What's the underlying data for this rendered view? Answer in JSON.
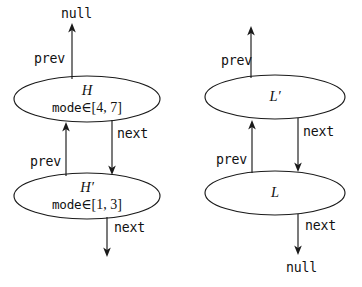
{
  "diagram": {
    "type": "doubly-linked-list-node-diagram",
    "nodes": [
      {
        "id": "H",
        "label": "H",
        "detail_name": "mode",
        "detail_relation": "∈",
        "detail_value": "[4, 7]"
      },
      {
        "id": "Hp",
        "label": "H′",
        "detail_name": "mode",
        "detail_relation": "∈",
        "detail_value": "[1, 3]"
      },
      {
        "id": "Lp",
        "label": "L′",
        "detail_name": "",
        "detail_relation": "",
        "detail_value": ""
      },
      {
        "id": "L",
        "label": "L",
        "detail_name": "",
        "detail_relation": "",
        "detail_value": ""
      }
    ],
    "terminals": [
      {
        "id": "null-top-left",
        "label": "null"
      },
      {
        "id": "null-bottom-right",
        "label": "null"
      }
    ],
    "edges": [
      {
        "id": "h-prev-null",
        "label": "prev",
        "from": "H",
        "to": "null-top-left",
        "direction": "up"
      },
      {
        "id": "h-next-hp",
        "label": "next",
        "from": "H",
        "to": "Hp",
        "direction": "down"
      },
      {
        "id": "hp-prev-h",
        "label": "prev",
        "from": "Hp",
        "to": "H",
        "direction": "up"
      },
      {
        "id": "hp-next-out",
        "label": "next",
        "from": "Hp",
        "to": "",
        "direction": "down"
      },
      {
        "id": "lp-prev-out",
        "label": "prev",
        "from": "Lp",
        "to": "",
        "direction": "up"
      },
      {
        "id": "lp-next-l",
        "label": "next",
        "from": "Lp",
        "to": "L",
        "direction": "down"
      },
      {
        "id": "l-prev-lp",
        "label": "prev",
        "from": "L",
        "to": "Lp",
        "direction": "up"
      },
      {
        "id": "l-next-null",
        "label": "next",
        "from": "L",
        "to": "null-bottom-right",
        "direction": "down"
      }
    ],
    "colors": {
      "stroke": "#1a1a1a",
      "text": "#111111",
      "background": "#ffffff"
    }
  }
}
